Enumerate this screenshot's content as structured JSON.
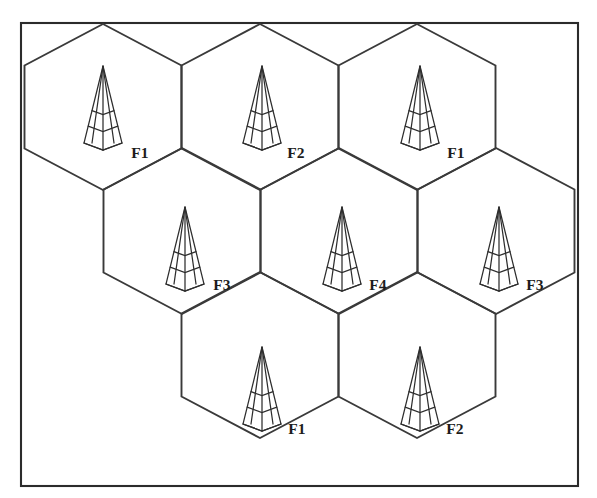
{
  "figure": {
    "width": 597,
    "height": 498,
    "background_color": "#ffffff",
    "line_color": "#3a3a3a",
    "frame_color": "#2b2b2b",
    "label_color": "#1c1c1c"
  },
  "frame": {
    "x": 21,
    "y": 23,
    "width": 557,
    "height": 463
  },
  "geometry": {
    "hex_half_width": 78.5,
    "hex_quarter_height": 41.5,
    "hex_half_height": 83,
    "row_step_y": 124,
    "col_step_x": 157
  },
  "cells": [
    {
      "id": "cell-1",
      "label": "F1",
      "row": 0,
      "col": 0,
      "cx": 103,
      "cy": 107,
      "tower_x": 103,
      "tower_y": 66,
      "tower_height": 84,
      "label_x": 140,
      "label_y": 158
    },
    {
      "id": "cell-2",
      "label": "F2",
      "row": 0,
      "col": 1,
      "cx": 260,
      "cy": 107,
      "tower_x": 262,
      "tower_y": 66,
      "tower_height": 84,
      "label_x": 296,
      "label_y": 158
    },
    {
      "id": "cell-3",
      "label": "F1",
      "row": 0,
      "col": 2,
      "cx": 417,
      "cy": 107,
      "tower_x": 420,
      "tower_y": 66,
      "tower_height": 84,
      "label_x": 456,
      "label_y": 158
    },
    {
      "id": "cell-4",
      "label": "F3",
      "row": 1,
      "col": 0,
      "cx": 182,
      "cy": 231,
      "tower_x": 185,
      "tower_y": 207,
      "tower_height": 84,
      "label_x": 222,
      "label_y": 290
    },
    {
      "id": "cell-5",
      "label": "F4",
      "row": 1,
      "col": 1,
      "cx": 339,
      "cy": 231,
      "tower_x": 342,
      "tower_y": 207,
      "tower_height": 84,
      "label_x": 378,
      "label_y": 290
    },
    {
      "id": "cell-6",
      "label": "F3",
      "row": 1,
      "col": 2,
      "cx": 496,
      "cy": 231,
      "tower_x": 499,
      "tower_y": 207,
      "tower_height": 84,
      "label_x": 535,
      "label_y": 290
    },
    {
      "id": "cell-7",
      "label": "F1",
      "row": 2,
      "col": 0,
      "cx": 260,
      "cy": 355,
      "tower_x": 262,
      "tower_y": 347,
      "tower_height": 84,
      "label_x": 297,
      "label_y": 434
    },
    {
      "id": "cell-8",
      "label": "F2",
      "row": 2,
      "col": 1,
      "cx": 417,
      "cy": 355,
      "tower_x": 420,
      "tower_y": 347,
      "tower_height": 84,
      "label_x": 455,
      "label_y": 434
    }
  ],
  "tower_icon": {
    "name": "transmitter-tower-icon",
    "description": "Tall narrow pyramid lattice tower with center mast and horizontal cross braces",
    "outer_half_base": 19,
    "inner_half_base": 11,
    "brace_fractions": [
      0.58,
      0.78
    ],
    "brace_dip": 7
  },
  "frequency_legend": {
    "unique_frequencies": [
      "F1",
      "F2",
      "F3",
      "F4"
    ],
    "cluster_size": 4,
    "counts": {
      "F1": 3,
      "F2": 2,
      "F3": 2,
      "F4": 1
    }
  }
}
